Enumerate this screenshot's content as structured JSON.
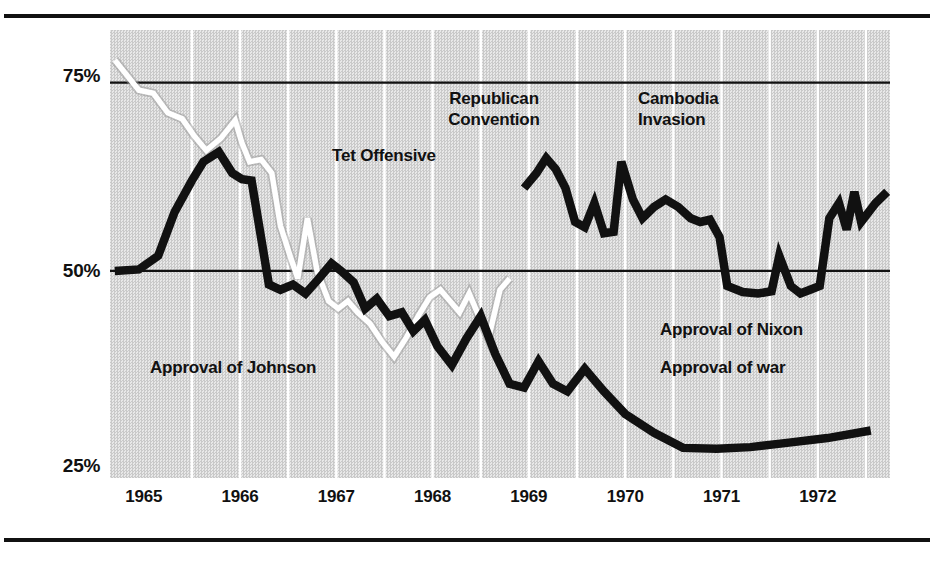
{
  "figure": {
    "background": "#ffffff",
    "plot_background": "#d8d8d8",
    "ink_color": "#111111",
    "johnson_color": "#ffffff",
    "war_color": "#111111",
    "nixon_color": "#111111"
  },
  "axis": {
    "y_ticks": [
      {
        "label": "75%",
        "value": 75
      },
      {
        "label": "50%",
        "value": 50
      },
      {
        "label": "25%",
        "value": 25
      }
    ],
    "x_ticks": [
      {
        "label": "1965"
      },
      {
        "label": "1966"
      },
      {
        "label": "1967"
      },
      {
        "label": "1968"
      },
      {
        "label": "1969"
      },
      {
        "label": "1970"
      },
      {
        "label": "1971"
      },
      {
        "label": "1972"
      }
    ]
  },
  "annotations": [
    {
      "id": "republican",
      "text": "Republican\nConvention"
    },
    {
      "id": "cambodia",
      "text": "Cambodia\nInvasion"
    },
    {
      "id": "tet",
      "text": "Tet Offensive"
    },
    {
      "id": "johnson",
      "text": "Approval of Johnson"
    },
    {
      "id": "nixon",
      "text": "Approval of Nixon"
    },
    {
      "id": "war",
      "text": "Approval of war"
    }
  ],
  "chart_data": {
    "type": "line",
    "title": "",
    "xlabel": "",
    "ylabel": "",
    "xlim": [
      1964.65,
      1972.75
    ],
    "ylim": [
      22.5,
      82.0
    ],
    "grid": {
      "horizontal_at": [
        75,
        50
      ],
      "vertical_at": [
        1965.5,
        1966.0,
        1966.5,
        1967.0,
        1967.5,
        1968.0,
        1968.5,
        1969.0,
        1969.5,
        1970.0,
        1970.5,
        1971.0,
        1971.5,
        1972.0,
        1972.5
      ],
      "vertical_color": "#ffffff",
      "horizontal_color": "#111111"
    },
    "legend_position": "inline-annotations",
    "series": [
      {
        "name": "Approval of Johnson",
        "color": "#ffffff",
        "points": [
          [
            1964.7,
            78.0
          ],
          [
            1964.95,
            74.0
          ],
          [
            1965.1,
            73.6
          ],
          [
            1965.25,
            71.0
          ],
          [
            1965.4,
            70.2
          ],
          [
            1965.52,
            68.0
          ],
          [
            1965.65,
            66.0
          ],
          [
            1965.8,
            67.6
          ],
          [
            1965.95,
            70.0
          ],
          [
            1966.02,
            67.0
          ],
          [
            1966.1,
            64.5
          ],
          [
            1966.22,
            64.8
          ],
          [
            1966.33,
            63.0
          ],
          [
            1966.42,
            56.0
          ],
          [
            1966.52,
            52.0
          ],
          [
            1966.6,
            49.0
          ],
          [
            1966.7,
            57.0
          ],
          [
            1966.8,
            50.0
          ],
          [
            1966.92,
            46.0
          ],
          [
            1967.02,
            45.0
          ],
          [
            1967.12,
            46.0
          ],
          [
            1967.22,
            44.5
          ],
          [
            1967.35,
            43.0
          ],
          [
            1967.48,
            40.5
          ],
          [
            1967.6,
            38.6
          ],
          [
            1967.72,
            41.0
          ],
          [
            1967.85,
            44.0
          ],
          [
            1967.97,
            46.5
          ],
          [
            1968.08,
            47.5
          ],
          [
            1968.18,
            46.0
          ],
          [
            1968.28,
            44.5
          ],
          [
            1968.38,
            47.0
          ],
          [
            1968.48,
            44.0
          ],
          [
            1968.58,
            41.0
          ],
          [
            1968.7,
            47.5
          ],
          [
            1968.8,
            49.0
          ]
        ]
      },
      {
        "name": "Approval of war",
        "color": "#111111",
        "points": [
          [
            1964.7,
            50.0
          ],
          [
            1964.95,
            50.2
          ],
          [
            1965.15,
            52.0
          ],
          [
            1965.32,
            57.8
          ],
          [
            1965.5,
            62.0
          ],
          [
            1965.62,
            64.5
          ],
          [
            1965.78,
            65.8
          ],
          [
            1965.92,
            63.0
          ],
          [
            1966.02,
            62.2
          ],
          [
            1966.12,
            62.0
          ],
          [
            1966.3,
            48.2
          ],
          [
            1966.42,
            47.5
          ],
          [
            1966.55,
            48.2
          ],
          [
            1966.68,
            47.0
          ],
          [
            1966.82,
            49.0
          ],
          [
            1966.95,
            51.0
          ],
          [
            1967.05,
            50.0
          ],
          [
            1967.18,
            48.5
          ],
          [
            1967.3,
            45.0
          ],
          [
            1967.42,
            46.3
          ],
          [
            1967.55,
            44.0
          ],
          [
            1967.68,
            44.5
          ],
          [
            1967.8,
            42.0
          ],
          [
            1967.92,
            43.5
          ],
          [
            1968.05,
            40.0
          ],
          [
            1968.2,
            37.5
          ],
          [
            1968.35,
            41.0
          ],
          [
            1968.5,
            44.0
          ],
          [
            1968.65,
            39.0
          ],
          [
            1968.8,
            35.0
          ],
          [
            1968.95,
            34.5
          ],
          [
            1969.1,
            38.0
          ],
          [
            1969.25,
            35.0
          ],
          [
            1969.4,
            34.0
          ],
          [
            1969.58,
            37.0
          ],
          [
            1969.78,
            34.0
          ],
          [
            1970.0,
            31.0
          ],
          [
            1970.3,
            28.5
          ],
          [
            1970.6,
            26.5
          ],
          [
            1970.95,
            26.4
          ],
          [
            1971.3,
            26.6
          ],
          [
            1971.7,
            27.2
          ],
          [
            1972.1,
            27.8
          ],
          [
            1972.55,
            28.8
          ]
        ]
      },
      {
        "name": "Approval of Nixon",
        "color": "#111111",
        "points": [
          [
            1968.95,
            61.0
          ],
          [
            1969.08,
            63.0
          ],
          [
            1969.18,
            65.0
          ],
          [
            1969.28,
            63.5
          ],
          [
            1969.38,
            61.0
          ],
          [
            1969.48,
            56.5
          ],
          [
            1969.58,
            55.8
          ],
          [
            1969.68,
            59.0
          ],
          [
            1969.78,
            55.0
          ],
          [
            1969.88,
            55.2
          ],
          [
            1969.96,
            64.5
          ],
          [
            1970.08,
            59.5
          ],
          [
            1970.18,
            57.0
          ],
          [
            1970.3,
            58.5
          ],
          [
            1970.42,
            59.5
          ],
          [
            1970.55,
            58.5
          ],
          [
            1970.68,
            57.0
          ],
          [
            1970.78,
            56.5
          ],
          [
            1970.88,
            56.8
          ],
          [
            1970.98,
            54.5
          ],
          [
            1971.06,
            48.0
          ],
          [
            1971.22,
            47.2
          ],
          [
            1971.38,
            47.0
          ],
          [
            1971.52,
            47.3
          ],
          [
            1971.6,
            52.0
          ],
          [
            1971.72,
            48.0
          ],
          [
            1971.82,
            47.0
          ],
          [
            1971.92,
            47.5
          ],
          [
            1972.02,
            48.0
          ],
          [
            1972.12,
            57.0
          ],
          [
            1972.22,
            59.0
          ],
          [
            1972.3,
            55.5
          ],
          [
            1972.38,
            60.5
          ],
          [
            1972.45,
            56.5
          ],
          [
            1972.6,
            59.0
          ],
          [
            1972.72,
            60.5
          ]
        ]
      }
    ]
  }
}
